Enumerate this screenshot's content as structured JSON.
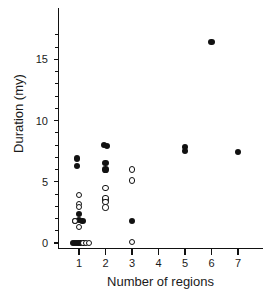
{
  "chart_data": {
    "type": "scatter",
    "title": "",
    "xlabel": "Number of regions",
    "ylabel": "Duration (my)",
    "xlim": [
      0.4,
      7.6
    ],
    "ylim": [
      -0.55,
      17.2
    ],
    "xticks": [
      1,
      2,
      3,
      4,
      5,
      6,
      7
    ],
    "xticklabels": [
      "1",
      "2",
      "3",
      "4",
      "5",
      "6",
      "7"
    ],
    "yticks": [
      0,
      5,
      10,
      15
    ],
    "yticklabels": [
      "0",
      "5",
      "10",
      "15"
    ],
    "yminorticks": [
      1,
      2,
      3,
      4,
      6,
      7,
      8,
      9,
      11,
      12,
      13,
      14,
      16,
      17
    ],
    "grid": false,
    "legend": null,
    "marker_colors": {
      "filled": "#111111",
      "open_edge": "#111111",
      "open_face": "#ffffff"
    },
    "series": [
      {
        "name": "filled",
        "marker": "filled-circle",
        "points": [
          {
            "x": 0.93,
            "y": 6.9
          },
          {
            "x": 0.93,
            "y": 6.3
          },
          {
            "x": 1.0,
            "y": 2.4
          },
          {
            "x": 1.0,
            "y": 1.85
          },
          {
            "x": 0.86,
            "y": 1.8
          },
          {
            "x": 1.13,
            "y": 1.8
          },
          {
            "x": 0.76,
            "y": 0.0
          },
          {
            "x": 0.84,
            "y": 0.0
          },
          {
            "x": 0.92,
            "y": 0.0
          },
          {
            "x": 1.0,
            "y": 0.0
          },
          {
            "x": 1.06,
            "y": 0.0
          },
          {
            "x": 1.93,
            "y": 8.0
          },
          {
            "x": 2.07,
            "y": 7.95
          },
          {
            "x": 2.0,
            "y": 6.5
          },
          {
            "x": 2.0,
            "y": 6.0
          },
          {
            "x": 2.0,
            "y": 3.55
          },
          {
            "x": 3.0,
            "y": 1.8
          },
          {
            "x": 5.0,
            "y": 7.85
          },
          {
            "x": 5.0,
            "y": 7.5
          },
          {
            "x": 6.0,
            "y": 16.4
          },
          {
            "x": 7.0,
            "y": 7.4
          }
        ]
      },
      {
        "name": "open",
        "marker": "open-circle",
        "points": [
          {
            "x": 1.0,
            "y": 3.9
          },
          {
            "x": 1.0,
            "y": 3.2
          },
          {
            "x": 1.0,
            "y": 2.95
          },
          {
            "x": 0.86,
            "y": 1.8
          },
          {
            "x": 1.0,
            "y": 1.3
          },
          {
            "x": 1.17,
            "y": 0.0
          },
          {
            "x": 1.27,
            "y": 0.0
          },
          {
            "x": 1.37,
            "y": 0.0
          },
          {
            "x": 2.0,
            "y": 4.5
          },
          {
            "x": 2.0,
            "y": 3.7
          },
          {
            "x": 2.0,
            "y": 3.35
          },
          {
            "x": 2.0,
            "y": 2.9
          },
          {
            "x": 3.0,
            "y": 6.0
          },
          {
            "x": 3.0,
            "y": 5.1
          },
          {
            "x": 3.0,
            "y": 0.1
          }
        ]
      }
    ]
  },
  "axes": {
    "ylabel_text": "Duration (my)",
    "xlabel_text": "Number of regions"
  }
}
